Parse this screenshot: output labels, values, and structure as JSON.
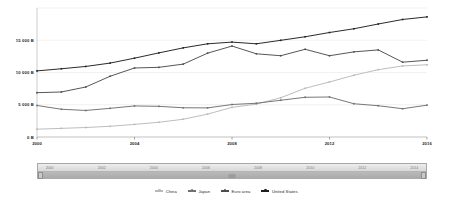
{
  "chart_data": {
    "type": "line",
    "title": "",
    "xlabel": "",
    "ylabel": "",
    "grid": true,
    "legend_position": "bottom",
    "x": [
      2000,
      2001,
      2002,
      2003,
      2004,
      2005,
      2006,
      2007,
      2008,
      2009,
      2010,
      2011,
      2012,
      2013,
      2014,
      2015,
      2016
    ],
    "xlim": [
      2000,
      2016
    ],
    "ylim": [
      0,
      20000
    ],
    "y_ticks": [
      0,
      5000,
      10000,
      15000
    ],
    "y_tick_labels": [
      "0 B",
      "5 000 B",
      "10 000 B",
      "15 000 B"
    ],
    "x_tick_labels": [
      "2000",
      "2004",
      "2008",
      "2012",
      "2016"
    ],
    "x_ticks": [
      2000,
      2004,
      2008,
      2012,
      2016
    ],
    "series": [
      {
        "name": "China",
        "color": "#b9b9b9",
        "values": [
          1211,
          1339,
          1471,
          1660,
          1955,
          2286,
          2752,
          3550,
          4594,
          5102,
          6087,
          7552,
          8532,
          9570,
          10438,
          11016,
          11199
        ]
      },
      {
        "name": "Japan",
        "color": "#707070",
        "values": [
          4888,
          4303,
          4115,
          4446,
          4815,
          4755,
          4530,
          4515,
          5038,
          5231,
          5700,
          6157,
          6203,
          5156,
          4850,
          4383,
          4940
        ]
      },
      {
        "name": "Euro area",
        "color": "#4d4d4d",
        "values": [
          6870,
          6980,
          7750,
          9420,
          10700,
          10800,
          11300,
          13000,
          14100,
          12900,
          12600,
          13600,
          12600,
          13200,
          13500,
          11600,
          11900
        ]
      },
      {
        "name": "United States",
        "color": "#1f1f1f",
        "values": [
          10250,
          10580,
          10940,
          11460,
          12220,
          13040,
          13820,
          14450,
          14710,
          14450,
          14990,
          15540,
          16200,
          16780,
          17520,
          18220,
          18620
        ]
      }
    ]
  },
  "range_slider": {
    "years": [
      "2000",
      "2002",
      "2004",
      "2006",
      "2008",
      "2010",
      "2012",
      "2014"
    ],
    "handle_left_label": "",
    "handle_right_label": ""
  },
  "legend": {
    "items": [
      {
        "label": "China"
      },
      {
        "label": "Japan"
      },
      {
        "label": "Euro area"
      },
      {
        "label": "United States"
      }
    ]
  }
}
